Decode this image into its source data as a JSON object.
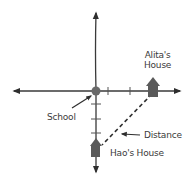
{
  "diagram": {
    "type": "coordinate-plane-map",
    "origin_label": "School",
    "points": [
      {
        "id": "alita",
        "label_line1": "Alita's",
        "label_line2": "House",
        "x_units": 3,
        "y_units": 0
      },
      {
        "id": "hao",
        "label": "Hao's House",
        "x_units": 0,
        "y_units": -4
      }
    ],
    "segment_label": "Distance",
    "colors": {
      "axis": "#3a3a3a",
      "house": "#5a5a5a",
      "origin_dot": "#6a6a6a",
      "text": "#3a3a3a"
    }
  }
}
